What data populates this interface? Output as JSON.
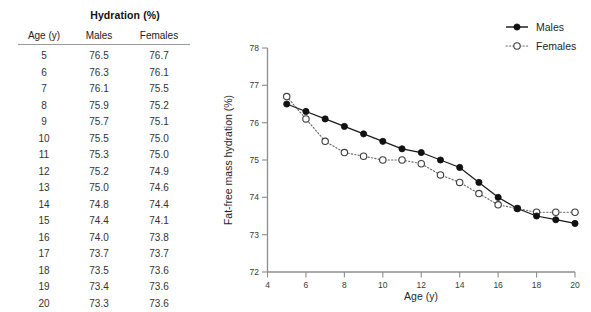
{
  "table": {
    "title": "Hydration (%)",
    "columns": [
      "Age (y)",
      "Males",
      "Females"
    ],
    "rows": [
      [
        "5",
        "76.5",
        "76.7"
      ],
      [
        "6",
        "76.3",
        "76.1"
      ],
      [
        "7",
        "76.1",
        "75.5"
      ],
      [
        "8",
        "75.9",
        "75.2"
      ],
      [
        "9",
        "75.7",
        "75.1"
      ],
      [
        "10",
        "75.5",
        "75.0"
      ],
      [
        "11",
        "75.3",
        "75.0"
      ],
      [
        "12",
        "75.2",
        "74.9"
      ],
      [
        "13",
        "75.0",
        "74.6"
      ],
      [
        "14",
        "74.8",
        "74.4"
      ],
      [
        "15",
        "74.4",
        "74.1"
      ],
      [
        "16",
        "74.0",
        "73.8"
      ],
      [
        "17",
        "73.7",
        "73.7"
      ],
      [
        "18",
        "73.5",
        "73.6"
      ],
      [
        "19",
        "73.4",
        "73.6"
      ],
      [
        "20",
        "73.3",
        "73.6"
      ]
    ]
  },
  "chart_data": {
    "type": "line",
    "title": "",
    "xlabel": "Age (y)",
    "ylabel": "Fat-free mass hydration (%)",
    "x": [
      5,
      6,
      7,
      8,
      9,
      10,
      11,
      12,
      13,
      14,
      15,
      16,
      17,
      18,
      19,
      20
    ],
    "xlim": [
      4,
      20
    ],
    "ylim": [
      72,
      78
    ],
    "xticks": [
      4,
      6,
      8,
      10,
      12,
      14,
      16,
      18,
      20
    ],
    "xtick_labels": [
      "4",
      "6",
      "8",
      "10",
      "12",
      "14",
      "16",
      "18",
      "20"
    ],
    "yticks": [
      72,
      73,
      74,
      75,
      76,
      77,
      78
    ],
    "ytick_labels": [
      "72",
      "73",
      "74",
      "75",
      "76",
      "77",
      "78"
    ],
    "grid": false,
    "legend_position": "top-right",
    "series": [
      {
        "name": "Males",
        "marker": "filled-circle",
        "line_style": "solid",
        "color": "#111111",
        "values": [
          76.5,
          76.3,
          76.1,
          75.9,
          75.7,
          75.5,
          75.3,
          75.2,
          75.0,
          74.8,
          74.4,
          74.0,
          73.7,
          73.5,
          73.4,
          73.3
        ]
      },
      {
        "name": "Females",
        "marker": "open-circle",
        "line_style": "dotted",
        "color": "#6b6b6b",
        "values": [
          76.7,
          76.1,
          75.5,
          75.2,
          75.1,
          75.0,
          75.0,
          74.9,
          74.6,
          74.4,
          74.1,
          73.8,
          73.7,
          73.6,
          73.6,
          73.6
        ]
      }
    ]
  }
}
